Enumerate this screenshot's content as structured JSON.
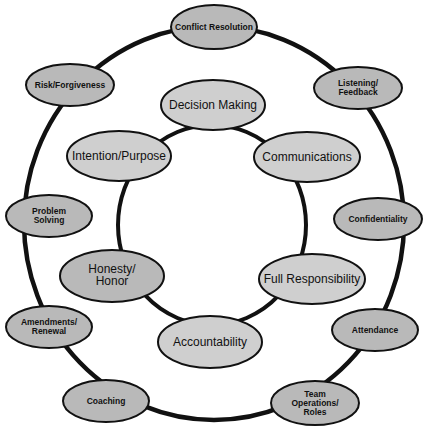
{
  "diagram": {
    "title": "",
    "colors": {
      "background": "#ffffff",
      "ring_stroke": "#111111",
      "outer_fill": "#b9b9b9",
      "inner_fill": "#cfcfcf",
      "node_stroke": "#111111",
      "text": "#111111"
    },
    "outer_ring": {
      "nodes": [
        {
          "label_lines": [
            "Conflict Resolution"
          ]
        },
        {
          "label_lines": [
            "Listening/",
            "Feedback"
          ]
        },
        {
          "label_lines": [
            "Confidentiality"
          ]
        },
        {
          "label_lines": [
            "Attendance"
          ]
        },
        {
          "label_lines": [
            "Team",
            "Operations/",
            "Roles"
          ]
        },
        {
          "label_lines": [
            "Coaching"
          ]
        },
        {
          "label_lines": [
            "Amendments/",
            "Renewal"
          ]
        },
        {
          "label_lines": [
            "Problem",
            "Solving"
          ]
        },
        {
          "label_lines": [
            "Risk/Forgiveness"
          ]
        }
      ]
    },
    "inner_ring": {
      "nodes": [
        {
          "label_lines": [
            "Decision Making"
          ]
        },
        {
          "label_lines": [
            "Communications"
          ]
        },
        {
          "label_lines": [
            "Full Responsibility"
          ]
        },
        {
          "label_lines": [
            "Accountability"
          ]
        },
        {
          "label_lines": [
            "Honesty/",
            "Honor"
          ]
        },
        {
          "label_lines": [
            "Intention/Purpose"
          ]
        }
      ]
    }
  }
}
